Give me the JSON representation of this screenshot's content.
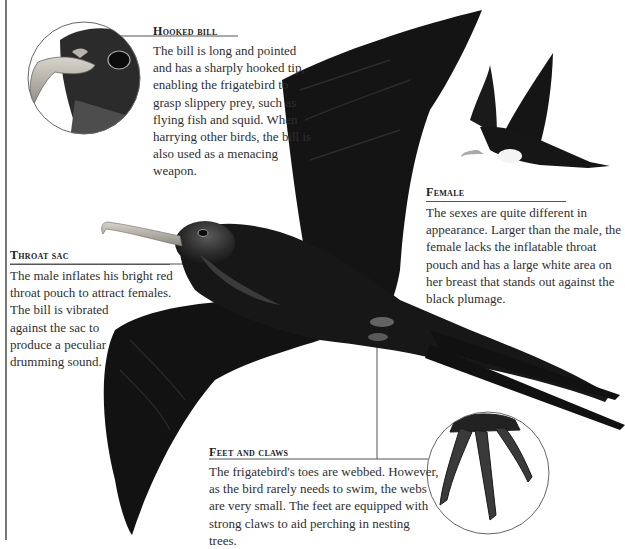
{
  "callouts": {
    "hooked_bill": {
      "heading": "Hooked bill",
      "text": "The bill is long and pointed and has a sharply hooked tip, enabling the frigatebird to grasp slippery prey, such as flying fish and squid. When harrying other birds, the bill is also used as a menacing weapon."
    },
    "throat_sac": {
      "heading": "Throat sac",
      "text_line1": "The male inflates his bright red throat pouch to attract females.",
      "text_line2": "The bill is vibrated against the sac to produce a peculiar drumming sound."
    },
    "female": {
      "heading": "Female",
      "text": "The sexes are quite different in appearance. Larger than the male, the female lacks the inflatable throat pouch and has a large white area on her breast that stands out against the black plumage."
    },
    "feet_and_claws": {
      "heading": "Feet and claws",
      "text": "The frigatebird's toes are webbed. However, as the bird rarely needs to swim, the webs are very small. The feet are equipped with strong claws to aid perching in nesting trees."
    }
  },
  "illustrations": {
    "main": "male-frigatebird-in-flight",
    "inset_head": "bill-closeup",
    "inset_feet": "feet-closeup",
    "female": "female-frigatebird-in-flight"
  },
  "colors": {
    "plumage": "#151515",
    "bill": "#b5b0a8",
    "rule": "#555555",
    "text": "#2f2f2f"
  }
}
